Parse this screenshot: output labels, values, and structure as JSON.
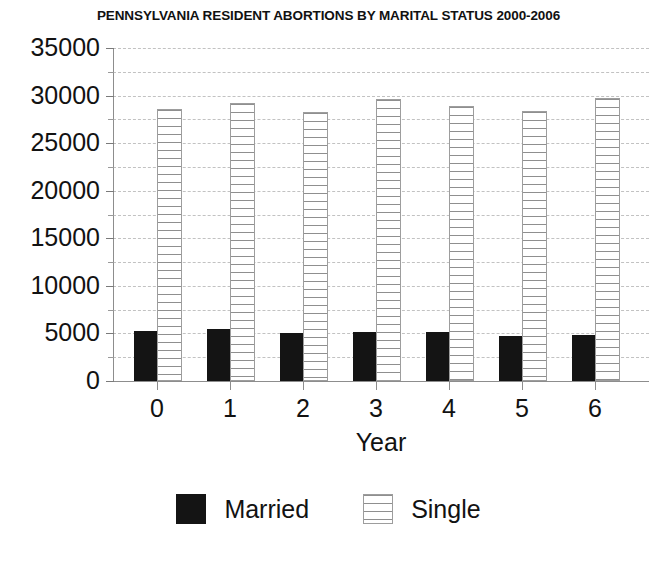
{
  "chart_data": {
    "type": "bar",
    "title": "PENNSYLVANIA RESIDENT ABORTIONS BY MARITAL STATUS 2000-2006",
    "xlabel": "Year",
    "ylabel": "",
    "categories": [
      "0",
      "1",
      "2",
      "3",
      "4",
      "5",
      "6"
    ],
    "series": [
      {
        "name": "Married",
        "color": "#141414",
        "pattern": "solid",
        "values": [
          5300,
          5500,
          5000,
          5200,
          5100,
          4700,
          4800
        ]
      },
      {
        "name": "Single",
        "color": "#8f8f8f",
        "pattern": "horizontal-hatch",
        "values": [
          28600,
          29200,
          28300,
          29600,
          28900,
          28400,
          29700
        ]
      }
    ],
    "ylim": [
      0,
      35000
    ],
    "ytick_values": [
      0,
      5000,
      10000,
      15000,
      20000,
      25000,
      30000,
      35000
    ],
    "ytick_labels": [
      "0",
      "5000",
      "10000",
      "15000",
      "20000",
      "25000",
      "30000",
      "35000"
    ],
    "yminor_values": [
      2500,
      7500,
      12500,
      17500,
      22500,
      27500,
      32500
    ],
    "grid": "horizontal-dashed",
    "legend_position": "bottom-center",
    "legend_entries": [
      "Married",
      "Single"
    ]
  },
  "axis": {
    "grid_color": "#c2c2c2",
    "spine_color": "#8d8d8d"
  }
}
